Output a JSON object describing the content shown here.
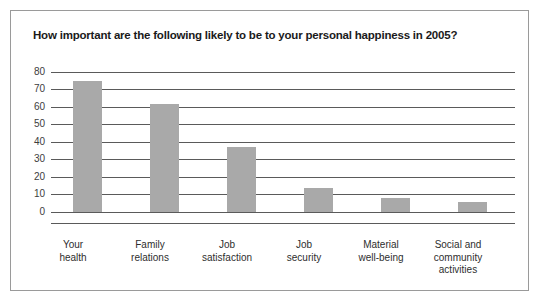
{
  "figure": {
    "title": "How important are the following likely to be to your personal happiness in 2005?",
    "border_color": "#9a9a9a",
    "background": "#ffffff"
  },
  "chart_data": {
    "type": "bar",
    "title": "How important are the following likely to be to your personal happiness in 2005?",
    "categories": [
      "Your health",
      "Family relations",
      "Job satisfaction",
      "Job security",
      "Material well-being",
      "Social and community activities"
    ],
    "category_lines": [
      [
        "Your",
        "health"
      ],
      [
        "Family",
        "relations"
      ],
      [
        "Job",
        "satisfaction"
      ],
      [
        "Job",
        "security"
      ],
      [
        "Material",
        "well-being"
      ],
      [
        "Social and",
        "community",
        "activities"
      ]
    ],
    "values": [
      75,
      62,
      37,
      14,
      8,
      6
    ],
    "xlabel": "",
    "ylabel": "",
    "ylim": [
      0,
      80
    ],
    "yticks": [
      0,
      10,
      20,
      30,
      40,
      50,
      60,
      70,
      80
    ],
    "ytick_labels": [
      "0",
      "10",
      "20",
      "30",
      "40",
      "50",
      "60",
      "70",
      "80"
    ],
    "grid": true,
    "grid_axis": "y",
    "legend": false,
    "bar_color": "#a9a9a9",
    "gridline_color": "#5a5a5a",
    "axis_color": "#5a5a5a"
  }
}
